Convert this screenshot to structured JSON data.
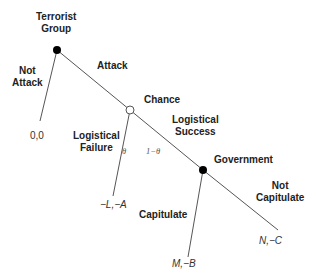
{
  "diagram": {
    "type": "game-tree",
    "nodes": {
      "terrorist": {
        "label_line1": "Terrorist",
        "label_line2": "Group",
        "fill": "#000000"
      },
      "chance": {
        "label": "Chance",
        "fill": "#ffffff"
      },
      "government": {
        "label": "Government",
        "fill": "#000000"
      }
    },
    "branches": {
      "not_attack": {
        "label_line1": "Not",
        "label_line2": "Attack",
        "payoff": "0,0"
      },
      "attack": {
        "label": "Attack"
      },
      "logistical_failure": {
        "label_line1": "Logistical",
        "label_line2": "Failure",
        "probability": "θ",
        "payoff": "−L,−A"
      },
      "logistical_success": {
        "label_line1": "Logistical",
        "label_line2": "Success",
        "probability": "1−θ"
      },
      "capitulate": {
        "label": "Capitulate",
        "payoff": "M,−B"
      },
      "not_capitulate": {
        "label_line1": "Not",
        "label_line2": "Capitulate",
        "payoff": "N,−C"
      }
    }
  }
}
